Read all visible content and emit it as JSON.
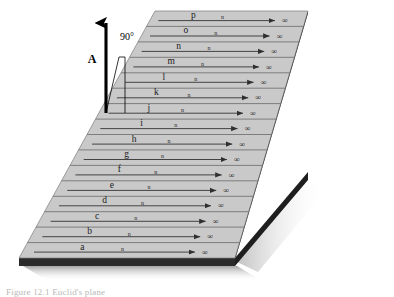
{
  "figure": {
    "caption": "Figure 12.1  Euclid's plane",
    "plane": {
      "fill_color": "#c9c9c9",
      "edge_color": "#2b2b2b",
      "shadow_color": "#9a9a9a",
      "line_color": "#4a4a4a"
    },
    "vector": {
      "label": "A",
      "angle_label": "90°",
      "color": "#000000"
    },
    "infinity_symbol": "∞",
    "midpoint_symbol": "n",
    "rows": [
      {
        "label": "p"
      },
      {
        "label": "o"
      },
      {
        "label": "n"
      },
      {
        "label": "m"
      },
      {
        "label": "l"
      },
      {
        "label": "k"
      },
      {
        "label": "j"
      },
      {
        "label": "i"
      },
      {
        "label": "h"
      },
      {
        "label": "g"
      },
      {
        "label": "f"
      },
      {
        "label": "e"
      },
      {
        "label": "d"
      },
      {
        "label": "c"
      },
      {
        "label": "b"
      },
      {
        "label": "a"
      }
    ]
  }
}
